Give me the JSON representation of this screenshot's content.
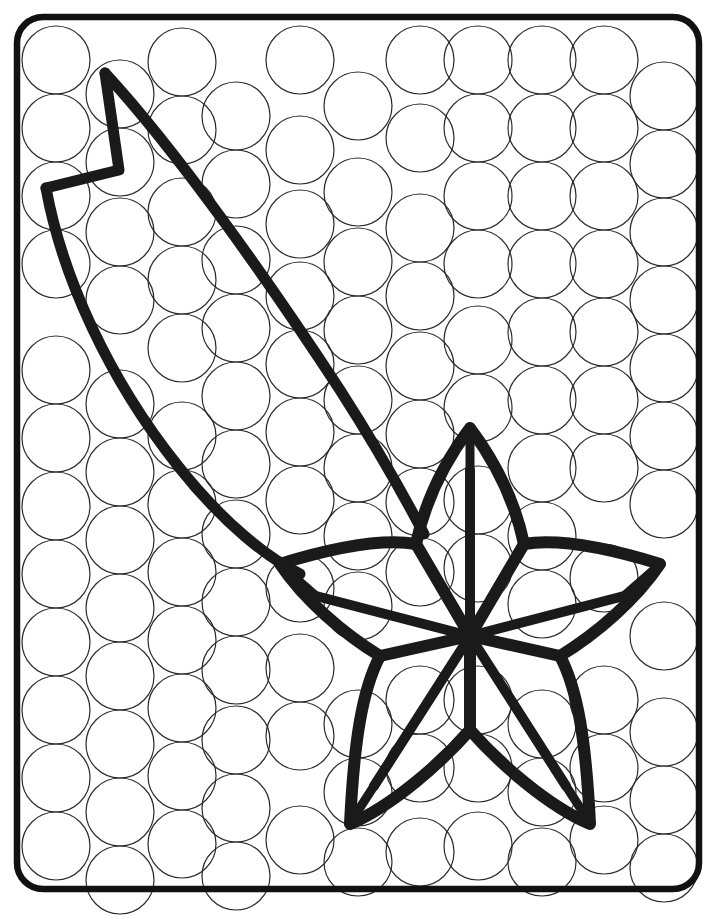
{
  "page": {
    "kind": "line-art-activity-sheet",
    "background_color": "#ffffff",
    "ink_color": "#1a1a1a",
    "dot_outline_color": "#2b2b2b",
    "canvas": {
      "width": 716,
      "height": 916
    }
  },
  "frame": {
    "name": "rounded-rectangle-border",
    "x": 17,
    "y": 17,
    "width": 682,
    "height": 872,
    "corner_radius": 26,
    "stroke_width": 6.5,
    "stroke_color": "#111111"
  },
  "dot_grid": {
    "description": "staggered hexagonal packing of empty circles to be filled with dot markers",
    "circle_diameter": 68,
    "circle_radius": 34,
    "stroke_width": 1.2,
    "stroke_color": "#2b2b2b",
    "fill": "none",
    "column_pitch": 66,
    "row_pitch": 68,
    "stagger_offset": 34,
    "columns": 10,
    "rows": 13,
    "circles": [
      {
        "cx": 56,
        "cy": 60
      },
      {
        "cx": 56,
        "cy": 128
      },
      {
        "cx": 56,
        "cy": 196
      },
      {
        "cx": 56,
        "cy": 264
      },
      {
        "cx": 56,
        "cy": 370
      },
      {
        "cx": 56,
        "cy": 438
      },
      {
        "cx": 56,
        "cy": 506
      },
      {
        "cx": 56,
        "cy": 574
      },
      {
        "cx": 56,
        "cy": 642
      },
      {
        "cx": 56,
        "cy": 710
      },
      {
        "cx": 56,
        "cy": 778
      },
      {
        "cx": 56,
        "cy": 846
      },
      {
        "cx": 120,
        "cy": 94
      },
      {
        "cx": 120,
        "cy": 162
      },
      {
        "cx": 120,
        "cy": 232
      },
      {
        "cx": 120,
        "cy": 300
      },
      {
        "cx": 120,
        "cy": 404
      },
      {
        "cx": 120,
        "cy": 472
      },
      {
        "cx": 120,
        "cy": 540
      },
      {
        "cx": 120,
        "cy": 608
      },
      {
        "cx": 120,
        "cy": 676
      },
      {
        "cx": 120,
        "cy": 744
      },
      {
        "cx": 120,
        "cy": 812
      },
      {
        "cx": 120,
        "cy": 880
      },
      {
        "cx": 182,
        "cy": 62
      },
      {
        "cx": 182,
        "cy": 130
      },
      {
        "cx": 182,
        "cy": 212
      },
      {
        "cx": 182,
        "cy": 280
      },
      {
        "cx": 182,
        "cy": 348
      },
      {
        "cx": 182,
        "cy": 436
      },
      {
        "cx": 182,
        "cy": 504
      },
      {
        "cx": 182,
        "cy": 572
      },
      {
        "cx": 182,
        "cy": 640
      },
      {
        "cx": 182,
        "cy": 708
      },
      {
        "cx": 182,
        "cy": 776
      },
      {
        "cx": 182,
        "cy": 844
      },
      {
        "cx": 236,
        "cy": 116
      },
      {
        "cx": 236,
        "cy": 184
      },
      {
        "cx": 236,
        "cy": 260
      },
      {
        "cx": 236,
        "cy": 328
      },
      {
        "cx": 236,
        "cy": 396
      },
      {
        "cx": 236,
        "cy": 464
      },
      {
        "cx": 236,
        "cy": 534
      },
      {
        "cx": 236,
        "cy": 602
      },
      {
        "cx": 236,
        "cy": 670
      },
      {
        "cx": 236,
        "cy": 740
      },
      {
        "cx": 236,
        "cy": 808
      },
      {
        "cx": 236,
        "cy": 876
      },
      {
        "cx": 300,
        "cy": 60
      },
      {
        "cx": 300,
        "cy": 150
      },
      {
        "cx": 300,
        "cy": 224
      },
      {
        "cx": 300,
        "cy": 296
      },
      {
        "cx": 300,
        "cy": 364
      },
      {
        "cx": 300,
        "cy": 432
      },
      {
        "cx": 300,
        "cy": 500
      },
      {
        "cx": 300,
        "cy": 588
      },
      {
        "cx": 300,
        "cy": 668
      },
      {
        "cx": 300,
        "cy": 736
      },
      {
        "cx": 300,
        "cy": 840
      },
      {
        "cx": 358,
        "cy": 106
      },
      {
        "cx": 358,
        "cy": 192
      },
      {
        "cx": 358,
        "cy": 262
      },
      {
        "cx": 358,
        "cy": 330
      },
      {
        "cx": 358,
        "cy": 400
      },
      {
        "cx": 358,
        "cy": 468
      },
      {
        "cx": 358,
        "cy": 536
      },
      {
        "cx": 358,
        "cy": 606
      },
      {
        "cx": 358,
        "cy": 724
      },
      {
        "cx": 358,
        "cy": 792
      },
      {
        "cx": 358,
        "cy": 862
      },
      {
        "cx": 420,
        "cy": 60
      },
      {
        "cx": 420,
        "cy": 138
      },
      {
        "cx": 420,
        "cy": 228
      },
      {
        "cx": 420,
        "cy": 296
      },
      {
        "cx": 420,
        "cy": 366
      },
      {
        "cx": 420,
        "cy": 434
      },
      {
        "cx": 420,
        "cy": 502
      },
      {
        "cx": 420,
        "cy": 572
      },
      {
        "cx": 420,
        "cy": 700
      },
      {
        "cx": 420,
        "cy": 768
      },
      {
        "cx": 420,
        "cy": 852
      },
      {
        "cx": 478,
        "cy": 60
      },
      {
        "cx": 478,
        "cy": 128
      },
      {
        "cx": 478,
        "cy": 196
      },
      {
        "cx": 478,
        "cy": 264
      },
      {
        "cx": 478,
        "cy": 340
      },
      {
        "cx": 478,
        "cy": 408
      },
      {
        "cx": 478,
        "cy": 500
      },
      {
        "cx": 478,
        "cy": 568
      },
      {
        "cx": 478,
        "cy": 700
      },
      {
        "cx": 478,
        "cy": 768
      },
      {
        "cx": 478,
        "cy": 846
      },
      {
        "cx": 542,
        "cy": 60
      },
      {
        "cx": 542,
        "cy": 128
      },
      {
        "cx": 542,
        "cy": 196
      },
      {
        "cx": 542,
        "cy": 264
      },
      {
        "cx": 542,
        "cy": 332
      },
      {
        "cx": 542,
        "cy": 400
      },
      {
        "cx": 542,
        "cy": 468
      },
      {
        "cx": 542,
        "cy": 536
      },
      {
        "cx": 542,
        "cy": 604
      },
      {
        "cx": 542,
        "cy": 724
      },
      {
        "cx": 542,
        "cy": 792
      },
      {
        "cx": 542,
        "cy": 862
      },
      {
        "cx": 604,
        "cy": 60
      },
      {
        "cx": 604,
        "cy": 128
      },
      {
        "cx": 604,
        "cy": 196
      },
      {
        "cx": 604,
        "cy": 264
      },
      {
        "cx": 604,
        "cy": 332
      },
      {
        "cx": 604,
        "cy": 400
      },
      {
        "cx": 604,
        "cy": 468
      },
      {
        "cx": 604,
        "cy": 578
      },
      {
        "cx": 604,
        "cy": 700
      },
      {
        "cx": 604,
        "cy": 768
      },
      {
        "cx": 604,
        "cy": 840
      },
      {
        "cx": 664,
        "cy": 96
      },
      {
        "cx": 664,
        "cy": 164
      },
      {
        "cx": 664,
        "cy": 232
      },
      {
        "cx": 664,
        "cy": 300
      },
      {
        "cx": 664,
        "cy": 368
      },
      {
        "cx": 664,
        "cy": 436
      },
      {
        "cx": 664,
        "cy": 504
      },
      {
        "cx": 664,
        "cy": 636
      },
      {
        "cx": 664,
        "cy": 732
      },
      {
        "cx": 664,
        "cy": 800
      },
      {
        "cx": 664,
        "cy": 868
      }
    ]
  },
  "feather": {
    "name": "feather-trail",
    "stroke_width": 11,
    "stroke_color": "#1a1a1a",
    "tip_notch": "zigzag",
    "upper_edge_path": "M 106 74 L 120 170 L 46 188",
    "spine_path": "M 106 74 C 190 160 300 330 380 470",
    "lower_edge_path": "M 46 188 C 80 300 170 430 292 556",
    "tip_points": [
      {
        "x": 106,
        "y": 74
      },
      {
        "x": 120,
        "y": 170
      },
      {
        "x": 46,
        "y": 188
      }
    ]
  },
  "star": {
    "name": "five-point-star-flower",
    "stroke_width": 12,
    "stroke_color": "#1a1a1a",
    "center": {
      "x": 470,
      "y": 636
    },
    "points": 5,
    "outer_radius": 210,
    "inner_radius": 96,
    "outer_tips": [
      {
        "label": "top",
        "x": 470,
        "y": 425
      },
      {
        "label": "right",
        "x": 668,
        "y": 568
      },
      {
        "label": "bottom-right",
        "x": 592,
        "y": 830
      },
      {
        "label": "bottom-left",
        "x": 348,
        "y": 830
      },
      {
        "label": "left",
        "x": 272,
        "y": 568
      }
    ],
    "inner_vertices": [
      {
        "x": 525,
        "y": 545
      },
      {
        "x": 561,
        "y": 658
      },
      {
        "x": 470,
        "y": 732
      },
      {
        "x": 379,
        "y": 658
      },
      {
        "x": 415,
        "y": 545
      }
    ],
    "center_hub_radius": 11,
    "petal_notch": "small dart at each tip",
    "radial_spokes": 10
  },
  "legend": {
    "instruction": "",
    "labels": []
  }
}
